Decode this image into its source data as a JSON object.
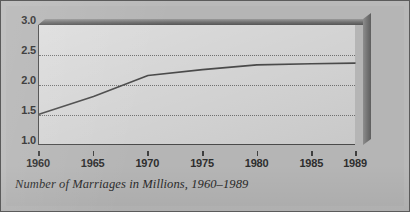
{
  "figure": {
    "caption": "Number of Marriages in Millions, 1960–1989",
    "background_color": "#b5b5b5",
    "plot_background_color": "#cfcfcf",
    "line_color": "#4a4a4a",
    "axis_color": "#4a4a4a",
    "text_color": "#2e2e2e"
  },
  "chart_data": {
    "type": "line",
    "title": "Number of Marriages in Millions, 1960–1989",
    "xlabel": "",
    "ylabel": "",
    "xlim": [
      1960,
      1989
    ],
    "ylim": [
      1.0,
      3.0
    ],
    "grid": true,
    "grid_axis": "y",
    "grid_style": "dotted",
    "legend": false,
    "legend_position": "none",
    "three_d_frame": true,
    "ytick_labels": [
      "3.0",
      "2.5",
      "2.0",
      "1.5",
      "1.0"
    ],
    "ytick_values": [
      3.0,
      2.5,
      2.0,
      1.5,
      1.0
    ],
    "gridline_values": [
      2.5,
      2.0,
      1.5
    ],
    "xtick_labels": [
      "1960",
      "1965",
      "1970",
      "1975",
      "1980",
      "1985",
      "1989"
    ],
    "xtick_values": [
      1960,
      1965,
      1970,
      1975,
      1980,
      1985,
      1989
    ],
    "x": [
      1960,
      1965,
      1970,
      1975,
      1980,
      1985,
      1989
    ],
    "values": [
      1.5,
      1.8,
      2.15,
      2.25,
      2.33,
      2.35,
      2.36
    ],
    "series": [
      {
        "name": "Number of Marriages",
        "units": "millions",
        "x": [
          1960,
          1965,
          1970,
          1975,
          1980,
          1985,
          1989
        ],
        "values": [
          1.5,
          1.8,
          2.15,
          2.25,
          2.33,
          2.35,
          2.36
        ]
      }
    ]
  }
}
